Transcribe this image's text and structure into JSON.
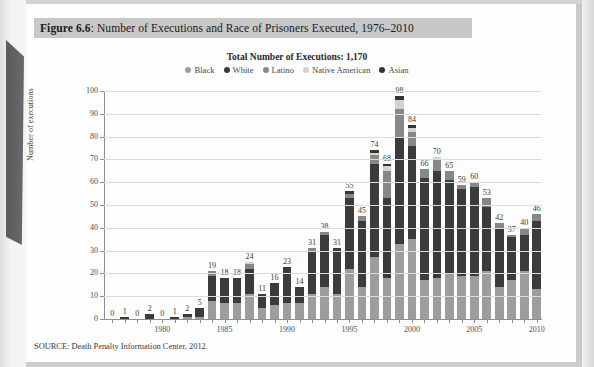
{
  "figure": {
    "label": "Figure 6.6",
    "caption": ": Number of Executions and Race of Prisoners Executed, 1976–2010"
  },
  "source": "SOURCE: Death Penalty Information Center, 2012.",
  "colors": {
    "black": "#9d9d9d",
    "white": "#3b3b3b",
    "latino": "#878787",
    "native_american": "#d2d2d2",
    "asian": "#343434",
    "grid": "#dcdcdc",
    "axis": "#8e8e8e",
    "caption_bg": "#c8c8c8"
  },
  "chart_data": {
    "type": "bar",
    "title": "Total Number of Executions: 1,170",
    "xlabel": "",
    "ylabel": "Number of executions",
    "ylim": [
      0,
      100
    ],
    "yticks": [
      0,
      10,
      20,
      30,
      40,
      50,
      60,
      70,
      80,
      90,
      100
    ],
    "grid": true,
    "legend_position": "top",
    "stacked": true,
    "xtick_labels": [
      "1980",
      "1985",
      "1990",
      "1995",
      "2000",
      "2005",
      "2010"
    ],
    "categories": [
      "1976",
      "1977",
      "1978",
      "1979",
      "1980",
      "1981",
      "1982",
      "1983",
      "1984",
      "1985",
      "1986",
      "1987",
      "1988",
      "1989",
      "1990",
      "1991",
      "1992",
      "1993",
      "1994",
      "1995",
      "1996",
      "1997",
      "1998",
      "1999",
      "2000",
      "2001",
      "2002",
      "2003",
      "2004",
      "2005",
      "2006",
      "2007",
      "2008",
      "2009",
      "2010"
    ],
    "totals": [
      0,
      1,
      0,
      2,
      0,
      1,
      2,
      5,
      21,
      18,
      18,
      25,
      11,
      16,
      23,
      14,
      31,
      38,
      31,
      56,
      45,
      74,
      68,
      98,
      85,
      66,
      71,
      65,
      59,
      60,
      53,
      42,
      37,
      40,
      46
    ],
    "labels": [
      "0",
      "1",
      "0",
      "2",
      "0",
      "1",
      "2",
      "5",
      "19",
      "18",
      "18",
      "24",
      "11",
      "16",
      "23",
      "14",
      "31",
      "38",
      "31",
      "55",
      "45",
      "74",
      "68",
      "98",
      "84",
      "66",
      "70",
      "65",
      "59",
      "60",
      "53",
      "42",
      "37",
      "40",
      "46"
    ],
    "series": [
      {
        "name": "Black",
        "values": [
          0,
          0,
          0,
          0,
          0,
          0,
          1,
          1,
          8,
          7,
          7,
          11,
          5,
          6,
          7,
          7,
          11,
          14,
          11,
          22,
          14,
          27,
          18,
          33,
          35,
          17,
          18,
          20,
          19,
          19,
          21,
          14,
          17,
          21,
          13
        ]
      },
      {
        "name": "White",
        "values": [
          0,
          1,
          0,
          2,
          0,
          1,
          1,
          4,
          11,
          11,
          11,
          11,
          6,
          10,
          16,
          7,
          19,
          23,
          20,
          31,
          29,
          41,
          35,
          47,
          41,
          45,
          47,
          41,
          38,
          39,
          28,
          26,
          19,
          16,
          30
        ]
      },
      {
        "name": "Latino",
        "values": [
          0,
          0,
          0,
          0,
          0,
          0,
          0,
          0,
          2,
          0,
          0,
          2,
          0,
          0,
          0,
          0,
          1,
          1,
          0,
          2,
          2,
          4,
          12,
          12,
          6,
          4,
          5,
          4,
          2,
          2,
          4,
          2,
          1,
          3,
          3
        ]
      },
      {
        "name": "Native American",
        "values": [
          0,
          0,
          0,
          0,
          0,
          0,
          0,
          0,
          0,
          0,
          0,
          1,
          0,
          0,
          0,
          0,
          0,
          0,
          0,
          0,
          0,
          1,
          2,
          4,
          2,
          0,
          1,
          0,
          0,
          0,
          0,
          0,
          0,
          0,
          0
        ]
      },
      {
        "name": "Asian",
        "values": [
          0,
          0,
          0,
          0,
          0,
          0,
          0,
          0,
          0,
          0,
          0,
          0,
          0,
          0,
          0,
          0,
          0,
          0,
          0,
          1,
          0,
          1,
          1,
          2,
          1,
          0,
          0,
          0,
          0,
          0,
          0,
          0,
          0,
          0,
          0
        ]
      }
    ]
  }
}
